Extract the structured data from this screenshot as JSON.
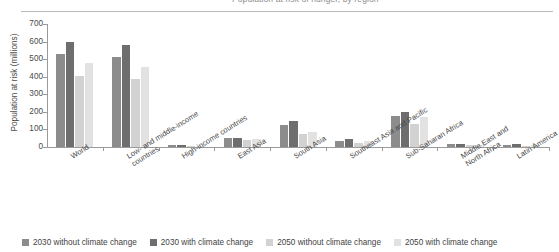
{
  "title": {
    "text": "Population at risk of hunger, by region",
    "cut_off": true
  },
  "axis": {
    "ylabel": "Population at risk (millions)",
    "yticks": [
      0,
      100,
      200,
      300,
      400,
      500,
      600,
      700
    ],
    "ymin": 0,
    "ymax": 700
  },
  "legend": {
    "items": [
      {
        "label": "2030 without climate change",
        "color": "#8c8c8c"
      },
      {
        "label": "2030 with climate change",
        "color": "#6e6e6e"
      },
      {
        "label": "2050 without climate change",
        "color": "#d2d2d2"
      },
      {
        "label": "2050 with climate change",
        "color": "#e2e2e2"
      }
    ]
  },
  "chart_data": {
    "type": "bar",
    "title": "Population at risk of hunger, by region",
    "xlabel": "",
    "ylabel": "Population at risk (millions)",
    "ylim": [
      0,
      700
    ],
    "grid": false,
    "legend_position": "bottom",
    "categories": [
      "World",
      "Low- and middle-income countries",
      "High-income countries",
      "East Asia",
      "South Asia",
      "Southeast Asia and Pacific",
      "Sub-Saharan Africa",
      "Middle East and North Africa",
      "Latin America"
    ],
    "series": [
      {
        "name": "2030 without climate change",
        "color": "#8c8c8c",
        "values": [
          530,
          512,
          9,
          50,
          123,
          36,
          175,
          17,
          13
        ]
      },
      {
        "name": "2030 with climate change",
        "color": "#6e6e6e",
        "values": [
          595,
          578,
          10,
          52,
          150,
          44,
          202,
          20,
          16
        ]
      },
      {
        "name": "2050 without climate change",
        "color": "#d2d2d2",
        "values": [
          405,
          388,
          5,
          42,
          73,
          21,
          130,
          9,
          7
        ]
      },
      {
        "name": "2050 with climate change",
        "color": "#e2e2e2",
        "values": [
          480,
          458,
          6,
          45,
          88,
          34,
          170,
          13,
          9
        ]
      }
    ]
  }
}
